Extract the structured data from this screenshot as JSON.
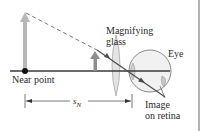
{
  "labels": {
    "magnifying_glass_line1": "Magnifying",
    "magnifying_glass_line2": "glass",
    "eye": "Eye",
    "near_point": "Near point",
    "distance_symbol": "s",
    "distance_subscript": "N",
    "image_line1": "Image",
    "image_line2": "on retina"
  },
  "colors": {
    "axis": "#3a3a3a",
    "object_arrow": "#b5b5b5",
    "small_arrow": "#8a8a8a",
    "ray": "#555555",
    "lens_fill": "#e6e6e6",
    "eye_fill": "#f0f0f0",
    "border": "#999999"
  }
}
